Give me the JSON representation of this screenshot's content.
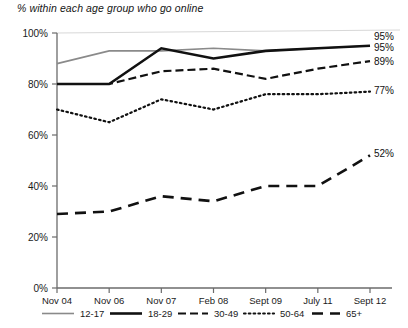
{
  "chart_data": {
    "type": "line",
    "title": "% within each age group who go online",
    "xlabel": "",
    "ylabel": "",
    "ylim": [
      0,
      100
    ],
    "ytick_labels": [
      "0%",
      "20%",
      "40%",
      "60%",
      "80%",
      "100%"
    ],
    "ytick_values": [
      0,
      20,
      40,
      60,
      80,
      100
    ],
    "grid": false,
    "legend_position": "bottom",
    "categories": [
      "Nov 04",
      "Nov 06",
      "Nov 07",
      "Feb 08",
      "Sept 09",
      "July 11",
      "Sept 12"
    ],
    "series": [
      {
        "name": "12-17",
        "style": "solid-thin-gray",
        "color": "#8a8a8a",
        "values": [
          88,
          93,
          93,
          94,
          93,
          94,
          95
        ],
        "end_label": "95%"
      },
      {
        "name": "18-29",
        "style": "solid-thick-black",
        "color": "#111111",
        "values": [
          80,
          80,
          94,
          90,
          93,
          94,
          95
        ],
        "end_label": "95%"
      },
      {
        "name": "30-49",
        "style": "dashed",
        "color": "#111111",
        "values": [
          80,
          80,
          85,
          86,
          82,
          86,
          89
        ],
        "end_label": "89%"
      },
      {
        "name": "50-64",
        "style": "dotted",
        "color": "#111111",
        "values": [
          70,
          65,
          74,
          70,
          76,
          76,
          77
        ],
        "end_label": "77%"
      },
      {
        "name": "65+",
        "style": "long-dash",
        "color": "#111111",
        "values": [
          29,
          30,
          36,
          34,
          40,
          40,
          52
        ],
        "end_label": "52%"
      }
    ],
    "end_labels": [
      "95%",
      "95%",
      "89%",
      "77%",
      "52%"
    ],
    "legend_entries": [
      "12-17",
      "18-29",
      "30-49",
      "50-64",
      "65+"
    ]
  }
}
